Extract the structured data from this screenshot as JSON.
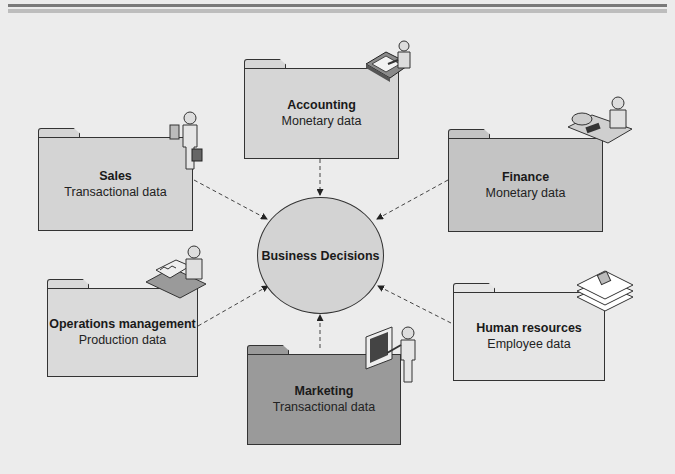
{
  "diagram": {
    "center": {
      "label": "Business Decisions",
      "color": "#d3d3d3"
    },
    "departments": [
      {
        "id": "accounting",
        "title": "Accounting",
        "subtitle": "Monetary data",
        "color": "#d6d6d6",
        "icon": "accountant-at-desk-icon"
      },
      {
        "id": "sales",
        "title": "Sales",
        "subtitle": "Transactional data",
        "color": "#d4d4d4",
        "icon": "salesperson-with-briefcase-icon"
      },
      {
        "id": "finance",
        "title": "Finance",
        "subtitle": "Monetary data",
        "color": "#c4c4c4",
        "icon": "finance-person-with-calculator-icon"
      },
      {
        "id": "operations",
        "title": "Operations management",
        "subtitle": "Production data",
        "color": "#dadada",
        "icon": "operations-worker-at-desk-icon"
      },
      {
        "id": "hr",
        "title": "Human resources",
        "subtitle": "Employee data",
        "color": "#e6e6e6",
        "icon": "employee-records-icon"
      },
      {
        "id": "marketing",
        "title": "Marketing",
        "subtitle": "Transactional data",
        "color": "#9a9a9a",
        "icon": "presenter-with-screen-icon"
      }
    ],
    "edges": [
      {
        "from": "accounting",
        "to": "Business Decisions",
        "style": "dashed-arrow"
      },
      {
        "from": "sales",
        "to": "Business Decisions",
        "style": "dashed-arrow"
      },
      {
        "from": "finance",
        "to": "Business Decisions",
        "style": "dashed-arrow"
      },
      {
        "from": "operations",
        "to": "Business Decisions",
        "style": "dashed-arrow"
      },
      {
        "from": "hr",
        "to": "Business Decisions",
        "style": "dashed-arrow"
      },
      {
        "from": "marketing",
        "to": "Business Decisions",
        "style": "dashed-arrow"
      }
    ]
  }
}
